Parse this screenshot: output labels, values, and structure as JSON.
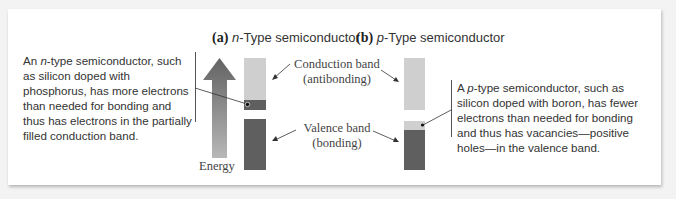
{
  "panel_a": {
    "label": "(a)",
    "title_italic": "n",
    "title_rest": "-Type semiconductor",
    "note_pre": "An ",
    "note_italic": "n",
    "note_post": "-type semiconductor, such as silicon doped with phosphorus, has more electrons than needed for bonding and thus has electrons in the partially filled conduction band.",
    "energy_label": "Energy",
    "conduction_label_line1": "Conduction band",
    "conduction_label_line2": "(antibonding)",
    "valence_label_line1": "Valence band",
    "valence_label_line2": "(bonding)"
  },
  "panel_b": {
    "label": "(b)",
    "title_italic": "p",
    "title_rest": "-Type semiconductor",
    "note_pre": "A ",
    "note_italic": "p",
    "note_post": "-type semiconductor, such as silicon doped with boron, has fewer electrons than needed for bonding and thus has vacancies—positive holes—in the valence band."
  },
  "colors": {
    "conduction_band": "#cfcfcf",
    "filled_band": "#5f5f5f",
    "arrow_top": "#666666",
    "arrow_bottom": "#b5b5b5"
  }
}
